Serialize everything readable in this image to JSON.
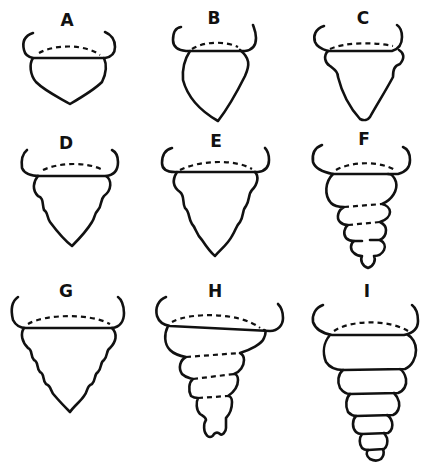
{
  "figure": {
    "panels": [
      {
        "id": "A",
        "label": "A",
        "shape": "smooth rounded body with a pointed bottom",
        "segments": 0
      },
      {
        "id": "B",
        "label": "B",
        "shape": "smooth teardrop body, longer, pointed bottom",
        "segments": 0
      },
      {
        "id": "C",
        "label": "C",
        "shape": "body with one lobed bulge near top, tapering to a point",
        "segments": 1
      },
      {
        "id": "D",
        "label": "D",
        "shape": "body with scalloped sides (several small lobes), pointed bottom",
        "segments": 3
      },
      {
        "id": "E",
        "label": "E",
        "shape": "longer body with scalloped sides, pointed bottom",
        "segments": 4
      },
      {
        "id": "F",
        "label": "F",
        "shape": "stacked rings with dashed divisions, narrowing to rounded tip",
        "segments": 5
      },
      {
        "id": "G",
        "label": "G",
        "shape": "wide body with many small scallops on both sides, pointed bottom",
        "segments": 6
      },
      {
        "id": "H",
        "label": "H",
        "shape": "stacked rings with dashed divisions, narrowing to small nipple tip",
        "segments": 6
      },
      {
        "id": "I",
        "label": "I",
        "shape": "stacked rings with solid divisions, narrowing to small rounded tip",
        "segments": 6
      }
    ]
  }
}
